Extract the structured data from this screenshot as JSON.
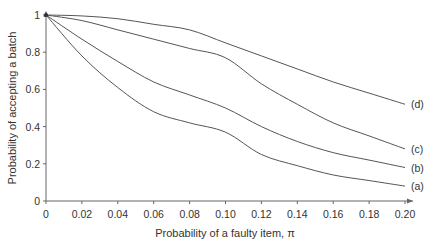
{
  "chart_data": {
    "type": "line",
    "title": "",
    "xlabel": "Probability of a faulty item, π",
    "ylabel": "Probability of accepting a batch",
    "xlim": [
      0,
      0.2
    ],
    "ylim": [
      0,
      1
    ],
    "x_ticks": [
      "0",
      "0.02",
      "0.04",
      "0.06",
      "0.08",
      "0.10",
      "0.12",
      "0.14",
      "0.16",
      "0.18",
      "0.20"
    ],
    "y_ticks": [
      "0",
      "0.2",
      "0.4",
      "0.6",
      "0.8",
      "1"
    ],
    "grid": false,
    "legend": "inline labels at right end of curves",
    "x": [
      0,
      0.02,
      0.04,
      0.06,
      0.08,
      0.1,
      0.12,
      0.14,
      0.16,
      0.18,
      0.2
    ],
    "series": [
      {
        "name": "(a)",
        "values": [
          1.0,
          0.78,
          0.61,
          0.48,
          0.42,
          0.37,
          0.25,
          0.19,
          0.14,
          0.11,
          0.08
        ]
      },
      {
        "name": "(b)",
        "values": [
          1.0,
          0.87,
          0.75,
          0.64,
          0.57,
          0.5,
          0.4,
          0.32,
          0.26,
          0.22,
          0.18
        ]
      },
      {
        "name": "(c)",
        "values": [
          1.0,
          0.97,
          0.92,
          0.87,
          0.82,
          0.77,
          0.63,
          0.52,
          0.42,
          0.35,
          0.28
        ]
      },
      {
        "name": "(d)",
        "values": [
          1.0,
          0.995,
          0.98,
          0.95,
          0.92,
          0.85,
          0.78,
          0.71,
          0.64,
          0.58,
          0.52
        ]
      }
    ]
  }
}
